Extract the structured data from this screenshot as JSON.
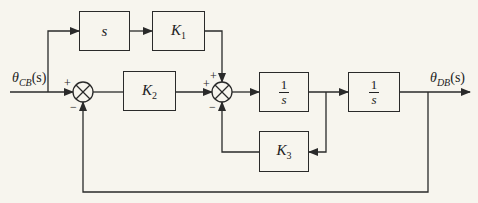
{
  "diagram": {
    "type": "block_diagram",
    "input": {
      "symbol": "θ",
      "subscript": "CB",
      "arg": "(s)"
    },
    "output": {
      "symbol": "θ",
      "subscript": "DB",
      "arg": "(s)"
    },
    "blocks": {
      "s_block": {
        "label": "s"
      },
      "k1": {
        "label": "K",
        "sub": "1"
      },
      "k2": {
        "label": "K",
        "sub": "2"
      },
      "k3": {
        "label": "K",
        "sub": "3"
      },
      "int1": {
        "num": "1",
        "den": "s"
      },
      "int2": {
        "num": "1",
        "den": "s"
      }
    },
    "summing_junctions": {
      "sum1": {
        "plus": "+",
        "minus": "−"
      },
      "sum2": {
        "plus_top": "+",
        "plus_left": "+",
        "minus": "−"
      }
    },
    "line_color": "#2a2a2a",
    "background": "#f7f5ee"
  }
}
